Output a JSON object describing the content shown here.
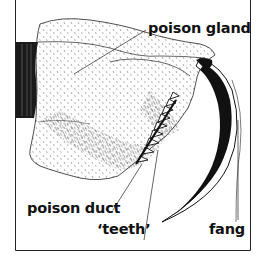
{
  "figure": {
    "labels": {
      "poison_gland": "poison gland",
      "poison_duct": "poison duct",
      "teeth": "‘teeth’",
      "fang": "fang"
    },
    "colors": {
      "ink": "#111111",
      "background": "#ffffff",
      "frame": "#222222"
    }
  }
}
